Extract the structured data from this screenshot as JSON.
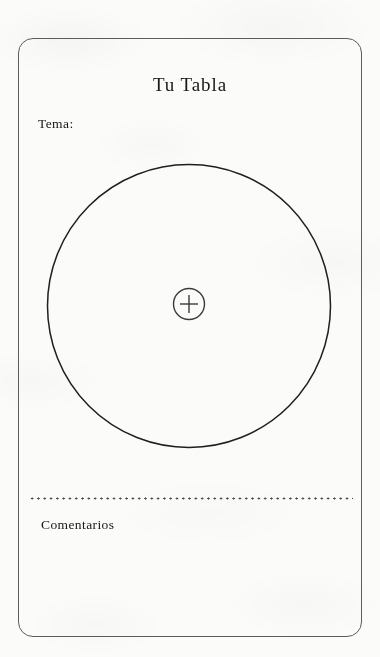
{
  "page": {
    "background_color": "#fbfbfa",
    "document_type": "printable-worksheet"
  },
  "card": {
    "border_color": "#5c5c5c",
    "title": "Tu Tabla",
    "topic_label": "Tema:",
    "comments_label": "Comentarios"
  },
  "wheel": {
    "stroke_color": "#1f1f1f",
    "center_button_icon": "plus-icon",
    "center_button_symbol": "+"
  },
  "separator": {
    "style": "dotted",
    "color": "#4a4a4a"
  }
}
